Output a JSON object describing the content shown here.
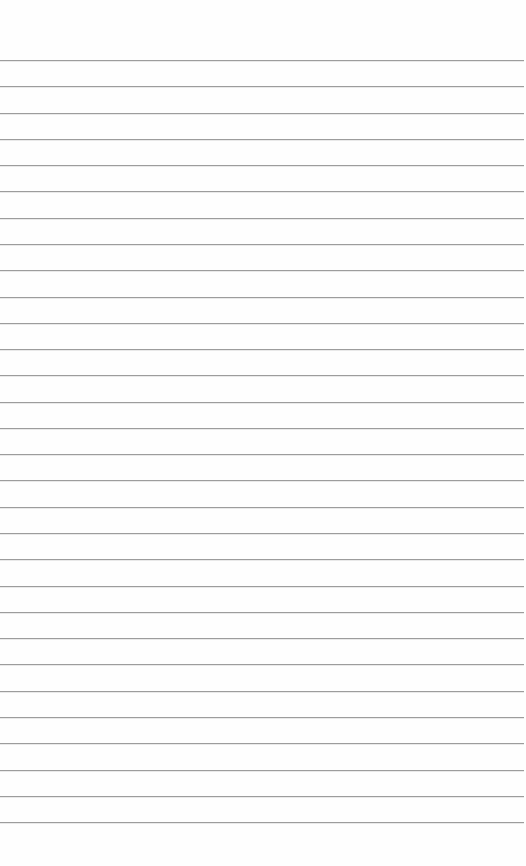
{
  "page": {
    "type": "lined-paper",
    "background": "#fefefe",
    "line_color": "#9c9c9c",
    "line_count": 30,
    "first_line_y": 60,
    "line_spacing": 26.28
  }
}
